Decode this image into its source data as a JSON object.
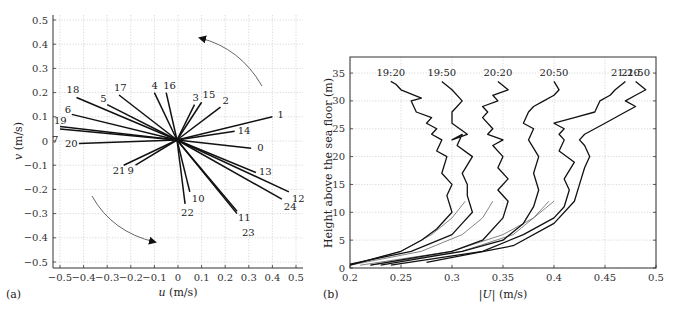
{
  "chart_data": [
    {
      "panel": "(a)",
      "type": "line",
      "subtype": "hodograph",
      "title": "",
      "xlabel": "u (m/s)",
      "ylabel": "v (m/s)",
      "xlim": [
        -0.5,
        0.5
      ],
      "ylim": [
        -0.5,
        0.5
      ],
      "xticks": [
        "-0.5",
        "-0.4",
        "-0.3",
        "-0.2",
        "-0.1",
        "0",
        "0.1",
        "0.2",
        "0.3",
        "0.4",
        "0.5"
      ],
      "yticks": [
        "0.5",
        "0.4",
        "0.3",
        "0.2",
        "0.1",
        "0",
        "-0.1",
        "-0.2",
        "-0.3",
        "-0.4",
        "-0.5"
      ],
      "grid": true,
      "annotations": [
        "counter-clockwise rotation arrow (upper right)",
        "clockwise rotation arrow (lower left)"
      ],
      "vectors": [
        {
          "label": "0",
          "u": 0.31,
          "v": -0.03
        },
        {
          "label": "1",
          "u": 0.4,
          "v": 0.1
        },
        {
          "label": "2",
          "u": 0.18,
          "v": 0.14
        },
        {
          "label": "3",
          "u": 0.07,
          "v": 0.15
        },
        {
          "label": "4",
          "u": -0.1,
          "v": 0.2
        },
        {
          "label": "5",
          "u": -0.3,
          "v": 0.15
        },
        {
          "label": "6",
          "u": -0.45,
          "v": 0.11
        },
        {
          "label": "7",
          "u": -0.5,
          "v": 0.05
        },
        {
          "label": "9",
          "u": -0.18,
          "v": -0.1
        },
        {
          "label": "10",
          "u": 0.05,
          "v": -0.21
        },
        {
          "label": "11",
          "u": 0.25,
          "v": -0.29
        },
        {
          "label": "12",
          "u": 0.47,
          "v": -0.21
        },
        {
          "label": "13",
          "u": 0.33,
          "v": -0.13
        },
        {
          "label": "14",
          "u": 0.24,
          "v": 0.04
        },
        {
          "label": "15",
          "u": 0.1,
          "v": 0.16
        },
        {
          "label": "16",
          "u": -0.05,
          "v": 0.2
        },
        {
          "label": "17",
          "u": -0.25,
          "v": 0.19
        },
        {
          "label": "18",
          "u": -0.43,
          "v": 0.18
        },
        {
          "label": "19",
          "u": -0.5,
          "v": 0.06
        },
        {
          "label": "20",
          "u": -0.42,
          "v": -0.01
        },
        {
          "label": "21",
          "u": -0.23,
          "v": -0.1
        },
        {
          "label": "22",
          "u": 0.03,
          "v": -0.26
        },
        {
          "label": "23",
          "u": 0.25,
          "v": -0.3
        },
        {
          "label": "24",
          "u": 0.44,
          "v": -0.24
        }
      ]
    },
    {
      "panel": "(b)",
      "type": "line",
      "title": "",
      "xlabel": "|U| (m/s)",
      "ylabel": "Height above the sea floor (m)",
      "xlim": [
        0.2,
        0.5
      ],
      "ylim": [
        0,
        37
      ],
      "xticks": [
        "0.2",
        "0.25",
        "0.3",
        "0.35",
        "0.4",
        "0.45",
        "0.5"
      ],
      "yticks": [
        "0",
        "5",
        "10",
        "15",
        "20",
        "25",
        "30",
        "35"
      ],
      "grid": true,
      "series": [
        {
          "name": "19:20",
          "U": [
            0.2,
            0.25,
            0.27,
            0.285,
            0.3,
            0.295,
            0.3,
            0.29,
            0.295,
            0.285,
            0.29,
            0.28,
            0.285,
            0.275,
            0.28,
            0.265,
            0.26,
            0.27,
            0.25,
            0.245,
            0.24
          ],
          "h": [
            0.5,
            3,
            5,
            7,
            10,
            13,
            15,
            17,
            20,
            21,
            23,
            24,
            25,
            26,
            27,
            28,
            30,
            30.5,
            32,
            33,
            33.5
          ]
        },
        {
          "name": "19:50",
          "U": [
            0.2,
            0.26,
            0.3,
            0.31,
            0.32,
            0.315,
            0.315,
            0.31,
            0.32,
            0.305,
            0.31,
            0.3,
            0.315,
            0.3,
            0.3,
            0.305,
            0.31,
            0.3,
            0.29
          ],
          "h": [
            0.7,
            3,
            6,
            8,
            10,
            13,
            15,
            17,
            20,
            22,
            24,
            23,
            24,
            26,
            28,
            29,
            30,
            32,
            33.5
          ]
        },
        {
          "name": "20:20",
          "U": [
            0.22,
            0.3,
            0.33,
            0.35,
            0.355,
            0.345,
            0.355,
            0.345,
            0.35,
            0.34,
            0.35,
            0.335,
            0.34,
            0.33,
            0.335,
            0.33,
            0.345,
            0.34,
            0.355,
            0.345
          ],
          "h": [
            0.5,
            3,
            5,
            9,
            12,
            14,
            16,
            18,
            20,
            22,
            23,
            24,
            25,
            27,
            28,
            29,
            30,
            31,
            32,
            33.5
          ]
        },
        {
          "name": "20:50",
          "U": [
            0.23,
            0.31,
            0.35,
            0.37,
            0.38,
            0.385,
            0.38,
            0.385,
            0.375,
            0.38,
            0.37,
            0.375,
            0.38,
            0.39,
            0.4,
            0.405,
            0.4
          ],
          "h": [
            0.5,
            3,
            5,
            8,
            11,
            14,
            17,
            20,
            23,
            25,
            26,
            28,
            29,
            30,
            31,
            32,
            33.5
          ]
        },
        {
          "name": "21:20",
          "U": [
            0.24,
            0.33,
            0.37,
            0.4,
            0.41,
            0.415,
            0.41,
            0.42,
            0.405,
            0.41,
            0.405,
            0.41,
            0.4,
            0.42,
            0.44,
            0.445,
            0.455,
            0.46,
            0.47
          ],
          "h": [
            0.5,
            3,
            6,
            9,
            11,
            14,
            16,
            19,
            21,
            23,
            24,
            25,
            26,
            27,
            28,
            30,
            31,
            32,
            33.5
          ]
        },
        {
          "name": "21:50",
          "U": [
            0.275,
            0.36,
            0.4,
            0.42,
            0.425,
            0.43,
            0.435,
            0.43,
            0.425,
            0.43,
            0.44,
            0.45,
            0.47,
            0.48,
            0.47,
            0.48,
            0.49,
            0.48
          ],
          "h": [
            1,
            4,
            8,
            12,
            15,
            18,
            20,
            22,
            23,
            24,
            25,
            26,
            28,
            29,
            30,
            31,
            32,
            33.5
          ]
        }
      ],
      "fits": [
        {
          "name": "19:20 fit",
          "U": [
            0.2,
            0.25,
            0.28,
            0.3,
            0.313
          ],
          "h": [
            0.5,
            3,
            6,
            9,
            12
          ]
        },
        {
          "name": "19:50 fit",
          "U": [
            0.2,
            0.27,
            0.31,
            0.33,
            0.34
          ],
          "h": [
            0.5,
            3,
            6,
            9,
            12
          ]
        },
        {
          "name": "20:20 fit",
          "U": [
            0.21,
            0.3,
            0.35,
            0.38,
            0.395
          ],
          "h": [
            0.5,
            3,
            6,
            9,
            12
          ]
        },
        {
          "name": "20:50 fit",
          "U": [
            0.22,
            0.31,
            0.36,
            0.38,
            0.4
          ],
          "h": [
            0.5,
            3,
            6,
            9,
            12
          ]
        }
      ]
    }
  ],
  "panels": {
    "a": {
      "label": "(a)",
      "xlabel_italic": "u",
      "xlabel_unit": " (m/s)",
      "ylabel_italic": "v",
      "ylabel_unit": " (m/s)"
    },
    "b": {
      "label": "(b)",
      "xlabel_italic": "|U|",
      "xlabel_unit": " (m/s)",
      "ylabel": "Height above the sea floor (m)"
    }
  }
}
